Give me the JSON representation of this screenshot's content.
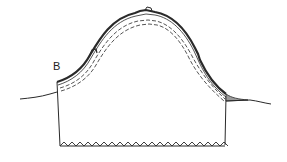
{
  "diagram": {
    "type": "cross-section",
    "labels": [
      {
        "id": "B",
        "text": "B"
      }
    ],
    "colors": {
      "line": "#2a2a2a",
      "fill_shaded": "#9a9a9a",
      "background": "#ffffff"
    },
    "elements": [
      "arched-dome-outer-thick-line",
      "inner-dashed-line-1",
      "inner-dashed-line-2",
      "left-wall",
      "right-wall",
      "zigzag-base",
      "left-ground-line",
      "right-ground-line-shaded"
    ]
  }
}
